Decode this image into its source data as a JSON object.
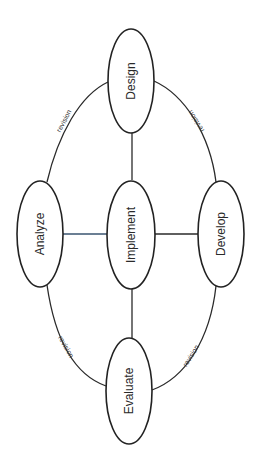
{
  "diagram": {
    "type": "cycle-with-hub",
    "orientation": "rotated 90deg counter-clockwise",
    "nodes": [
      {
        "id": "design",
        "label": "Design"
      },
      {
        "id": "analyze",
        "label": "Analyze"
      },
      {
        "id": "implement",
        "label": "Implement"
      },
      {
        "id": "develop",
        "label": "Develop"
      },
      {
        "id": "evaluate",
        "label": "Evaluate"
      }
    ],
    "edges": [
      {
        "from": "analyze",
        "to": "design",
        "label": "revision"
      },
      {
        "from": "design",
        "to": "develop",
        "label": "revision"
      },
      {
        "from": "develop",
        "to": "evaluate",
        "label": "revision"
      },
      {
        "from": "evaluate",
        "to": "analyze",
        "label": "revision"
      },
      {
        "from": "implement",
        "to": "design",
        "label": ""
      },
      {
        "from": "implement",
        "to": "analyze",
        "label": ""
      },
      {
        "from": "implement",
        "to": "develop",
        "label": ""
      },
      {
        "from": "implement",
        "to": "evaluate",
        "label": ""
      }
    ],
    "colors": {
      "stroke": "#222222",
      "hub_left_link": "#3a5470",
      "background": "#ffffff"
    }
  }
}
